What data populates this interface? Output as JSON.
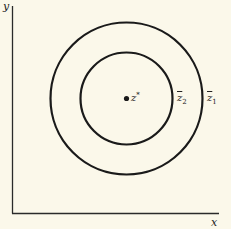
{
  "diagram": {
    "axes": {
      "y_label": "y",
      "x_label": "x"
    },
    "center_point": {
      "label": "z",
      "superscript": "*"
    },
    "circles": [
      {
        "name": "outer",
        "label": "z",
        "subscript": "1",
        "overline": true
      },
      {
        "name": "inner",
        "label": "z",
        "subscript": "2",
        "overline": true
      }
    ],
    "colors": {
      "background": "#fbf8ea",
      "stroke": "#1a1a1a"
    }
  }
}
